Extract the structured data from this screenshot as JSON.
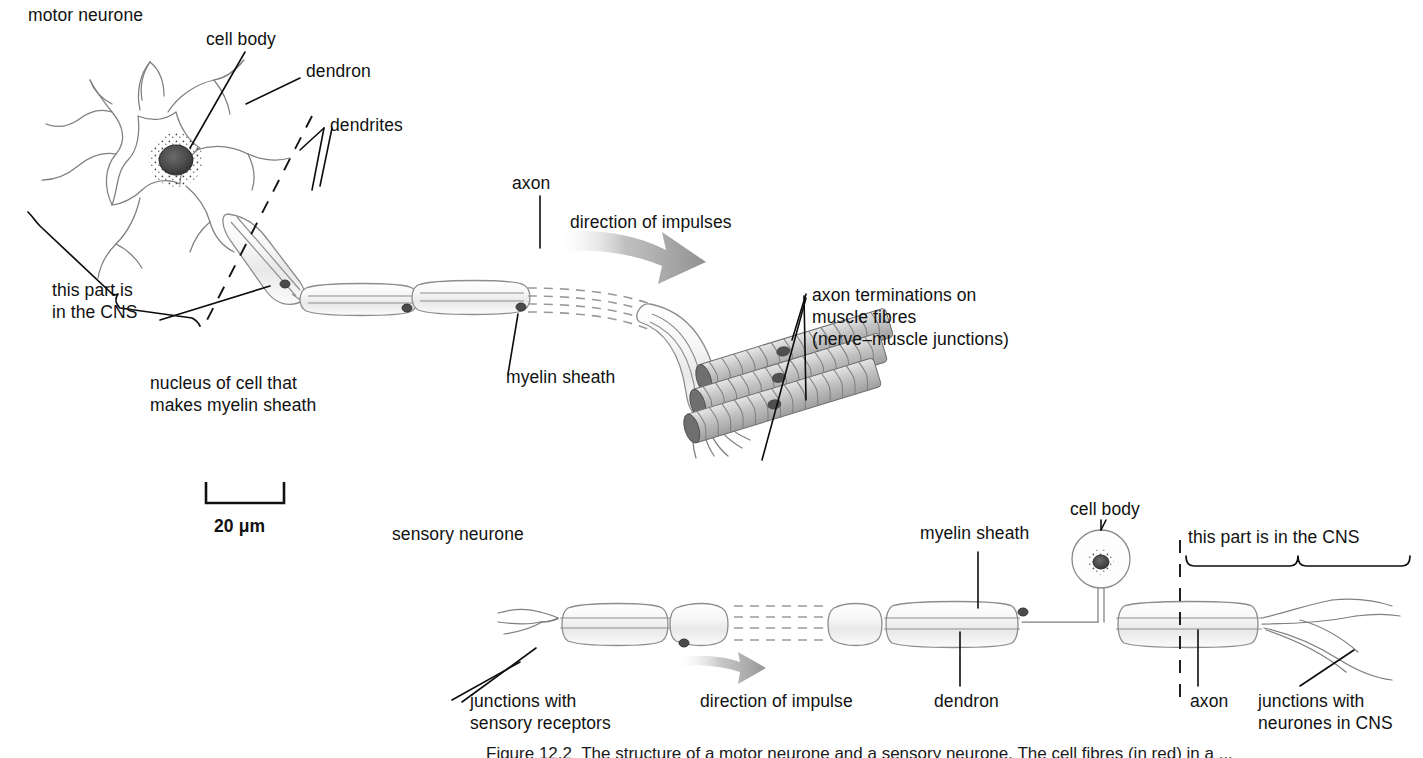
{
  "figure": {
    "motor_neurone_title": "motor neurone",
    "sensory_neurone_title": "sensory neurone",
    "scale_bar_label": "20 μm",
    "caption": "Figure 12.2  The structure of a motor neurone and a sensory neurone. The cell fibres (in red) in a ..."
  },
  "motor": {
    "labels": {
      "cell_body": "cell body",
      "dendron": "dendron",
      "dendrites": "dendrites",
      "axon": "axon",
      "direction_of_impulses": "direction of impulses",
      "myelin_sheath": "myelin sheath",
      "cns_line1": "this part is",
      "cns_line2": "in the CNS",
      "nucleus_line1": "nucleus of cell that",
      "nucleus_line2": "makes myelin sheath",
      "terminations_line1": "axon terminations on",
      "terminations_line2": "muscle fibres",
      "terminations_line3": "(nerve–muscle junctions)"
    }
  },
  "sensory": {
    "labels": {
      "myelin_sheath": "myelin sheath",
      "cell_body": "cell body",
      "cns": "this part is in the CNS",
      "junctions_sensory_line1": "junctions with",
      "junctions_sensory_line2": "sensory receptors",
      "direction_of_impulse": "direction of impulse",
      "dendron": "dendron",
      "axon": "axon",
      "junctions_cns_line1": "junctions with",
      "junctions_cns_line2": "neurones in CNS"
    }
  },
  "colors": {
    "ink": "#111111",
    "outline_grey": "#8a8a8a",
    "sheath_fill": "#f3f3f3",
    "muscle_grey": "#b9b9b9",
    "arrow_grey": "#9a9a9a",
    "nucleus_dark": "#3a3a3a"
  }
}
